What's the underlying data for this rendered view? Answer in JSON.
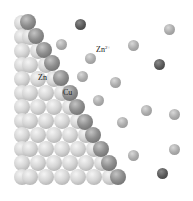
{
  "diagram": {
    "labels": {
      "zn": "Zn",
      "cu": "Cu",
      "zn_ion_base": "Zn",
      "zn_ion_charge": "2+"
    },
    "colors": {
      "zn_lattice": "#d0d0d0",
      "cu_edge": "#808080",
      "ion_light": "#a8a8a8",
      "ion_dark": "#505050",
      "background": "#ffffff"
    },
    "lattice": {
      "atom_diameter": 16,
      "left_edge_x": 14,
      "rows": [
        {
          "y": 15,
          "xs": [
            14
          ]
        },
        {
          "y": 29,
          "xs": [
            14,
            22
          ]
        },
        {
          "y": 43,
          "xs": [
            14,
            30
          ]
        },
        {
          "y": 57,
          "xs": [
            14,
            22,
            38
          ]
        },
        {
          "y": 71,
          "xs": [
            14,
            30,
            46
          ]
        },
        {
          "y": 85,
          "xs": [
            14,
            22,
            38,
            54
          ]
        },
        {
          "y": 99,
          "xs": [
            14,
            30,
            46,
            62
          ]
        },
        {
          "y": 113,
          "xs": [
            14,
            22,
            38,
            54,
            70
          ]
        },
        {
          "y": 127,
          "xs": [
            14,
            30,
            46,
            62,
            78
          ]
        },
        {
          "y": 141,
          "xs": [
            14,
            22,
            38,
            54,
            70,
            86
          ]
        },
        {
          "y": 155,
          "xs": [
            14,
            30,
            46,
            62,
            78,
            94
          ]
        },
        {
          "y": 169,
          "xs": [
            14,
            22,
            38,
            54,
            70,
            86,
            102
          ]
        }
      ]
    },
    "cu_edge_atoms": [
      {
        "x": 28,
        "y": 22
      },
      {
        "x": 36,
        "y": 36
      },
      {
        "x": 44,
        "y": 50
      },
      {
        "x": 52,
        "y": 63
      },
      {
        "x": 61,
        "y": 78
      },
      {
        "x": 70,
        "y": 93
      },
      {
        "x": 77,
        "y": 107
      },
      {
        "x": 85,
        "y": 122
      },
      {
        "x": 93,
        "y": 135
      },
      {
        "x": 101,
        "y": 149
      },
      {
        "x": 109,
        "y": 163
      },
      {
        "x": 118,
        "y": 177
      }
    ],
    "ions": [
      {
        "x": 80,
        "y": 24,
        "tone": "dark"
      },
      {
        "x": 61,
        "y": 44,
        "tone": "light"
      },
      {
        "x": 90,
        "y": 58,
        "tone": "light"
      },
      {
        "x": 82,
        "y": 76,
        "tone": "light"
      },
      {
        "x": 115,
        "y": 82,
        "tone": "light"
      },
      {
        "x": 98,
        "y": 100,
        "tone": "light"
      },
      {
        "x": 122,
        "y": 122,
        "tone": "light"
      },
      {
        "x": 133,
        "y": 45,
        "tone": "light"
      },
      {
        "x": 169,
        "y": 29,
        "tone": "light"
      },
      {
        "x": 159,
        "y": 64,
        "tone": "dark"
      },
      {
        "x": 146,
        "y": 110,
        "tone": "light"
      },
      {
        "x": 174,
        "y": 114,
        "tone": "light"
      },
      {
        "x": 174,
        "y": 149,
        "tone": "light"
      },
      {
        "x": 133,
        "y": 155,
        "tone": "light"
      },
      {
        "x": 162,
        "y": 173,
        "tone": "dark"
      }
    ],
    "ion_diameter": 11,
    "label_positions": {
      "zn": {
        "x": 38,
        "y": 74
      },
      "cu": {
        "x": 63,
        "y": 89
      },
      "zn_ion": {
        "x": 96,
        "y": 45
      }
    }
  }
}
